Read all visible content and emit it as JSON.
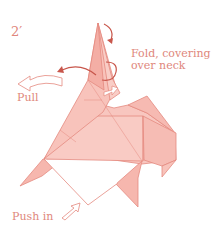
{
  "diagram": {
    "step_number": "2′",
    "labels": {
      "fold_line1": "Fold, covering",
      "fold_line2": "over neck",
      "pull": "Pull",
      "push": "Push in"
    },
    "colors": {
      "paper_fill": "#f8c6bf",
      "paper_dark": "#f3aea5",
      "line": "#e58a80",
      "arrow": "#c8564b",
      "text": "#e0877c"
    }
  }
}
